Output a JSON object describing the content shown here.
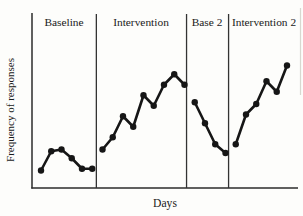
{
  "figure": {
    "background": "#fdfdfb",
    "line_color": "#161616",
    "axis_color": "#2b2b2b",
    "divider_color": "#333333",
    "marker": "filled-circle"
  },
  "chart_data": {
    "type": "line",
    "title": "",
    "xlabel": "Days",
    "ylabel": "Frequency of responses",
    "grid": false,
    "legend": "none",
    "axis_tick_labels": "none",
    "ylim": [
      0,
      10
    ],
    "x_unit": "day",
    "phases": [
      {
        "label": "Baseline",
        "days": [
          1,
          2,
          3,
          4,
          5,
          6
        ],
        "values": [
          1.0,
          2.1,
          2.2,
          1.7,
          1.1,
          1.1
        ]
      },
      {
        "label": "Intervention",
        "days": [
          7,
          8,
          9,
          10,
          11,
          12,
          13,
          14,
          15
        ],
        "values": [
          2.2,
          2.9,
          4.1,
          3.5,
          5.3,
          4.7,
          5.9,
          6.5,
          5.9
        ]
      },
      {
        "label": "Base 2",
        "days": [
          16,
          17,
          18,
          19
        ],
        "values": [
          4.9,
          3.7,
          2.5,
          2.0
        ]
      },
      {
        "label": "Intervention 2",
        "days": [
          20,
          21,
          22,
          23,
          24,
          25
        ],
        "values": [
          2.5,
          4.2,
          4.8,
          6.1,
          5.5,
          7.0
        ]
      }
    ],
    "phase_divider_days": [
      6.4,
      15.2,
      19.3
    ]
  }
}
